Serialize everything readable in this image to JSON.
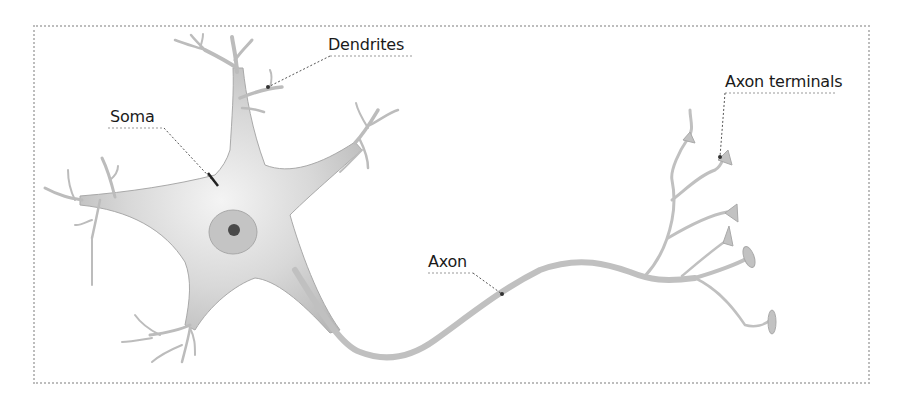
{
  "diagram": {
    "labels": {
      "dendrites": "Dendrites",
      "soma": "Soma",
      "axon": "Axon",
      "axon_terminals": "Axon terminals"
    },
    "colors": {
      "cell_fill": "#c8c8c8",
      "cell_highlight": "#f2f2f2",
      "nucleus": "#b5b5b5",
      "nucleolus": "#4a4a4a",
      "leader_line": "#555555",
      "frame": "#bdbdbd",
      "text": "#1a1a1a"
    }
  }
}
